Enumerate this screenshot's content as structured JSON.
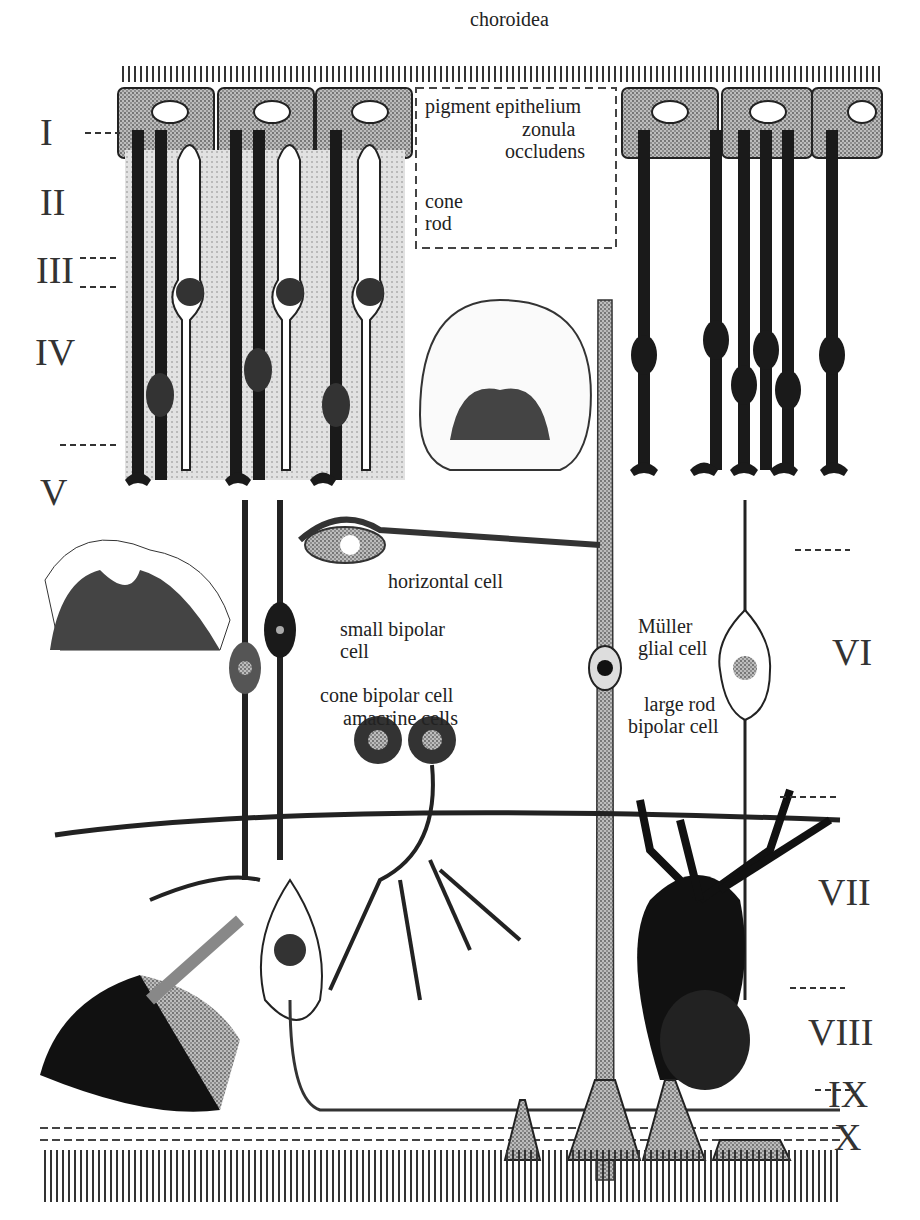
{
  "title": "choroidea",
  "labels": {
    "choroidea": "choroidea",
    "pigment_epithelium": "pigment epithelium",
    "zonula_occludens_1": "zonula",
    "zonula_occludens_2": "occludens",
    "cone": "cone",
    "rod": "rod",
    "horizontal_cell": "horizontal cell",
    "small_bipolar_1": "small bipolar",
    "small_bipolar_2": "cell",
    "cone_bipolar": "cone bipolar cell",
    "amacrine": "amacrine cells",
    "muller_1": "Müller",
    "muller_2": "glial cell",
    "large_rod_1": "large rod",
    "large_rod_2": "bipolar cell"
  },
  "layers": [
    "I",
    "II",
    "III",
    "IV",
    "V",
    "VI",
    "VII",
    "VIII",
    "IX",
    "X"
  ],
  "colors": {
    "ink": "#1a1a1a",
    "gray": "#9a9a9a",
    "light": "#cfcfcf"
  }
}
